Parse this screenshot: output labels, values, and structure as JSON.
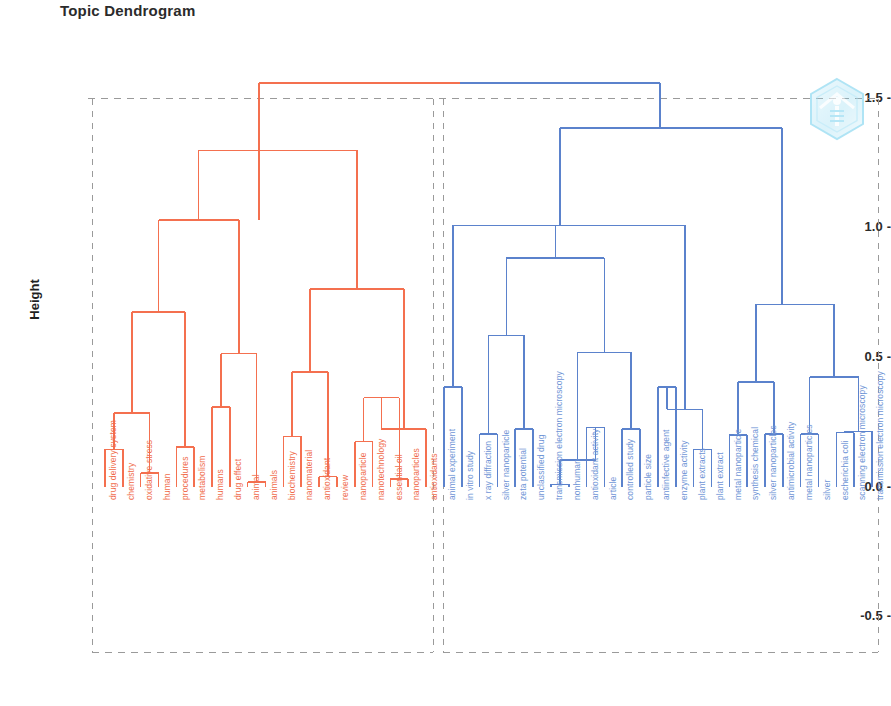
{
  "chart_data": {
    "type": "dendrogram",
    "title": "Topic Dendrogram",
    "xlabel": "",
    "ylabel": "Height",
    "yticks": [
      "1.5",
      "1.0",
      "0.5",
      "0.0",
      "-0.5"
    ],
    "ytick_values": [
      1.5,
      1.0,
      0.5,
      0.0,
      -0.5
    ],
    "ylim": [
      -0.75,
      1.62
    ],
    "grid": "dashed-horizontal-at-1.5",
    "colors": {
      "cluster_red": "#f4704f",
      "cluster_blue": "#5b82cc",
      "leaf_label_red": "#f06c4b",
      "leaf_label_blue": "#6f95d6",
      "grid": "#9a9a9a",
      "axis_text": "#2b2b2b",
      "background": "#ffffff",
      "watermark": "#7fd4ef"
    },
    "clusters": [
      {
        "name": "red",
        "color": "#f4704f",
        "leaves": [
          "drug delivery system",
          "chemistry",
          "oxidative stress",
          "human",
          "procedures",
          "metabolism",
          "humans",
          "drug effect",
          "animal",
          "animals",
          "biochemistry",
          "nanomaterial",
          "antioxidant",
          "review",
          "nanoparticle",
          "nanotechnology",
          "essential oil",
          "nanoparticles",
          "antioxidants"
        ]
      },
      {
        "name": "blue",
        "color": "#5b82cc",
        "leaves": [
          "animal experiment",
          "in vitro study",
          "x ray diffraction",
          "silver nanoparticle",
          "zeta potential",
          "unclassified drug",
          "transmission electron microscopy",
          "nonhuman",
          "antioxidant activity",
          "article",
          "controlled study",
          "particle size",
          "antiinfective agent",
          "enzyme activity",
          "plant extracts",
          "plant extract",
          "metal nanoparticle",
          "synthesis chemical",
          "silver nanoparticles",
          "antimicrobial activity",
          "metal nanoparticles",
          "silver",
          "escherichia coli",
          "scanning electron microscopy",
          "transmission electron microscopy"
        ]
      }
    ],
    "merges_red": [
      {
        "left": 0,
        "right": 1,
        "height": 0.15
      },
      {
        "left": 2,
        "right": 3,
        "height": 0.05
      },
      {
        "left": 4,
        "right": 5,
        "height": 0.15
      },
      {
        "left": 6,
        "right": 7,
        "height": 0.28
      },
      {
        "left": 8,
        "right": 9,
        "height": 0.16
      },
      {
        "left": 10,
        "right": 11,
        "height": 0.51
      },
      {
        "left": 12,
        "right": 13,
        "height": 0.31
      },
      {
        "left": 14,
        "right": 15,
        "height": 0.02
      },
      {
        "left": 16,
        "right": 17,
        "height": 0.67
      },
      {
        "left": 18,
        "right": 19,
        "height": 1.03
      },
      {
        "left": 20,
        "right": 21,
        "height": 0.19
      },
      {
        "left": 22,
        "right": 23,
        "height": 0.04
      },
      {
        "left": 24,
        "right": 25,
        "height": 0.44
      },
      {
        "left": 26,
        "right": 27,
        "height": 0.17
      },
      {
        "left": 28,
        "right": 29,
        "height": 0.03
      },
      {
        "left": 30,
        "right": 31,
        "height": 0.34
      },
      {
        "left": 32,
        "right": 33,
        "height": 0.22
      },
      {
        "left": 34,
        "right": 35,
        "height": 0.76
      },
      {
        "left": 36,
        "right": 37,
        "height": 1.56
      }
    ],
    "merges_blue": [
      {
        "height": 0.38
      },
      {
        "height": 0.2
      },
      {
        "height": 0.22
      },
      {
        "height": 0.58
      },
      {
        "height": 0.88
      },
      {
        "height": 0.23
      },
      {
        "height": 0.22
      },
      {
        "height": 0.52
      },
      {
        "height": 0.1
      },
      {
        "height": 0.38
      },
      {
        "height": 0.14
      },
      {
        "height": 0.3
      },
      {
        "height": 0.67
      },
      {
        "height": 0.2
      },
      {
        "height": 0.4
      },
      {
        "height": 0.2
      },
      {
        "height": 0.21
      },
      {
        "height": 0.42
      },
      {
        "height": 0.7
      },
      {
        "height": 1.06
      },
      {
        "height": 1.01
      },
      {
        "height": 1.38
      }
    ],
    "root_height": 1.56,
    "annotations": [
      "cluster-boundary dashed rectangles around each cluster"
    ]
  },
  "watermark": {
    "name": "hexagon-logo-watermark"
  }
}
